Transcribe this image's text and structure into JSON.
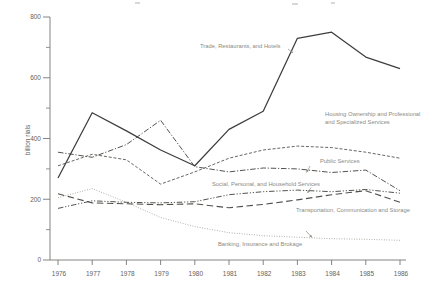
{
  "chart_data": {
    "type": "line",
    "title": "",
    "ylabel": "billion rials",
    "xlabel": "",
    "ylim": [
      0,
      800
    ],
    "grid": false,
    "legend": "inline-annotations",
    "x": [
      "1976",
      "1977",
      "1978",
      "1979",
      "1980",
      "1981",
      "1982",
      "1983",
      "1984",
      "1985",
      "1986"
    ],
    "y_tick_labels": [
      "0",
      "200",
      "400",
      "600",
      "800"
    ],
    "y_tick_values": [
      0,
      200,
      400,
      600,
      800
    ],
    "y_minor_tick_values": [
      100,
      300,
      500,
      700
    ],
    "series": [
      {
        "name": "Banking, Insurance and Brokage",
        "style": "dotted",
        "color": "#9a9992",
        "width": 0.85,
        "values": [
          205,
          235,
          190,
          140,
          110,
          90,
          80,
          75,
          70,
          68,
          65
        ]
      },
      {
        "name": "Transportation, Communication and Storage",
        "style": "long-dash",
        "color": "#4f4f4b",
        "width": 1.1,
        "values": [
          218,
          188,
          185,
          182,
          185,
          172,
          183,
          198,
          215,
          228,
          190
        ]
      },
      {
        "name": "Social, Personal, and Household Services",
        "style": "dash-dot-dot",
        "color": "#4a4a46",
        "width": 0.95,
        "values": [
          170,
          195,
          190,
          188,
          192,
          215,
          225,
          230,
          225,
          232,
          220
        ]
      },
      {
        "name": "Public Services",
        "style": "dash-dot",
        "color": "#4a4a46",
        "width": 0.95,
        "values": [
          355,
          338,
          380,
          460,
          307,
          290,
          303,
          300,
          288,
          296,
          228
        ]
      },
      {
        "name": "Housing Ownership and Professional and Specialized Services",
        "style": "short-dash",
        "color": "#55544f",
        "width": 0.9,
        "values": [
          310,
          348,
          330,
          250,
          290,
          335,
          362,
          375,
          370,
          355,
          335
        ]
      },
      {
        "name": "Trade, Restaurants, and Hotels",
        "style": "solid",
        "color": "#3d3d3d",
        "width": 1.25,
        "values": [
          270,
          485,
          425,
          362,
          310,
          430,
          490,
          730,
          750,
          668,
          630
        ]
      }
    ],
    "annotations": {
      "labels": [
        {
          "text": "Trade, Restaurants, and Hotels",
          "x": 200,
          "y": 47.5
        },
        {
          "text": "Housing Ownership and Professional",
          "x": 325,
          "y": 116
        },
        {
          "text": "and Specialized Services",
          "x": 325,
          "y": 124
        },
        {
          "text": "Public Services",
          "x": 320,
          "y": 163
        },
        {
          "text": "Social, Personal, and Household Services",
          "x": 212,
          "y": 186
        },
        {
          "text": "Transportation, Communication and Storage",
          "x": 296,
          "y": 212
        },
        {
          "text": "Banking, Insurance and Brokage",
          "x": 218,
          "y": 246
        }
      ],
      "arrows": [
        {
          "x1": 288,
          "y1": 49,
          "x2": 293,
          "y2": 53
        },
        {
          "x1": 310,
          "y1": 166,
          "x2": 306.5,
          "y2": 172.5
        },
        {
          "x1": 311,
          "y1": 187.5,
          "x2": 307.5,
          "y2": 193
        },
        {
          "x1": 306,
          "y1": 231,
          "x2": 312,
          "y2": 237.5
        }
      ]
    },
    "axis": {
      "color": "#777774",
      "tick_label_color": "#63625e",
      "annotation_color": "#8b8a83",
      "plot_left_px": 50,
      "plot_bottom_px": 260,
      "plot_top_px": 17,
      "plot_right_px": 406,
      "x_first_tick_px": 58,
      "x_tick_step_px": 34.2
    }
  }
}
